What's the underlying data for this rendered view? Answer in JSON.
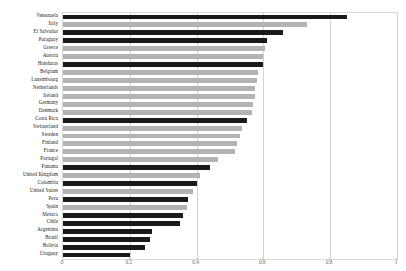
{
  "chart_data": {
    "type": "bar",
    "orientation": "horizontal",
    "title": "",
    "subtitle": "",
    "xlabel": "",
    "ylabel": "",
    "xlim": [
      0,
      1
    ],
    "grid": true,
    "legend": null,
    "xticks": [
      "0",
      "0.2",
      "0.4",
      "0.6",
      "0.8",
      "1"
    ],
    "xtick_values": [
      0,
      0.2,
      0.4,
      0.6,
      0.8,
      1
    ],
    "colors": {
      "dark": "#1a1a1a",
      "light": "#b3b3b3",
      "gridline": "#d2d2d2",
      "frame": "#d9d9d9",
      "label": "#1c1c1c",
      "tick": "#6e6e6e"
    },
    "categories": [
      "Venezuela",
      "Italy",
      "El Salvador",
      "Paraguay",
      "Greece",
      "Austria",
      "Honduras",
      "Belgium",
      "Luxembourg",
      "Netherlands",
      "Ireland",
      "Germany",
      "Denmark",
      "Costa Rica",
      "Switzerland",
      "Sweden",
      "Finland",
      "France",
      "Portugal",
      "Panama",
      "United Kingdom",
      "Colombia",
      "United States",
      "Peru",
      "Spain",
      "Mexico",
      "Chile",
      "Argentina",
      "Brazil",
      "Bolivia",
      "Uruguay"
    ],
    "values": [
      0.85,
      0.73,
      0.66,
      0.61,
      0.605,
      0.6,
      0.6,
      0.585,
      0.58,
      0.575,
      0.575,
      0.57,
      0.565,
      0.55,
      0.535,
      0.53,
      0.52,
      0.515,
      0.465,
      0.44,
      0.41,
      0.4,
      0.39,
      0.375,
      0.37,
      0.36,
      0.35,
      0.265,
      0.26,
      0.245,
      0.2
    ],
    "series_shade": [
      "dark",
      "light",
      "dark",
      "dark",
      "light",
      "light",
      "dark",
      "light",
      "light",
      "light",
      "light",
      "light",
      "light",
      "dark",
      "light",
      "light",
      "light",
      "light",
      "light",
      "dark",
      "light",
      "dark",
      "light",
      "dark",
      "light",
      "dark",
      "dark",
      "dark",
      "dark",
      "dark",
      "dark"
    ]
  }
}
